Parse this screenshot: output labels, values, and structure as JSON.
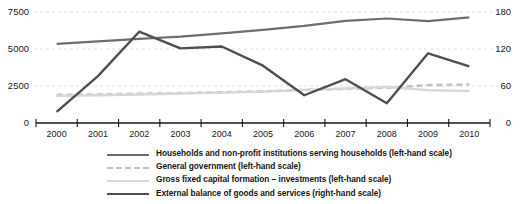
{
  "chart_data": {
    "type": "line",
    "title": "",
    "xlabel": "",
    "ylabel": "",
    "grid": true,
    "legend_position": "bottom",
    "categories": [
      "2000",
      "2001",
      "2002",
      "2003",
      "2004",
      "2005",
      "2006",
      "2007",
      "2008",
      "2009",
      "2010"
    ],
    "left_axis": {
      "label": "left-hand scale",
      "ticks": [
        "0",
        "2500",
        "5000",
        "7500"
      ],
      "tick_values": [
        0,
        2500,
        5000,
        7500
      ],
      "ylim": [
        0,
        7500
      ]
    },
    "right_axis": {
      "label": "right-hand scale",
      "ticks": [
        "0",
        "60",
        "120",
        "180"
      ],
      "tick_values": [
        0,
        60,
        120,
        180
      ],
      "ylim": [
        0,
        180
      ]
    },
    "series": [
      {
        "name": "Households and non-profit institutions serving households (left-hand scale)",
        "axis": "left",
        "style": "solid",
        "color": "#6e6e6e",
        "width": 2.2,
        "values": [
          5340,
          5520,
          5680,
          5830,
          6050,
          6290,
          6560,
          6900,
          7060,
          6880,
          7140
        ]
      },
      {
        "name": "General government (left-hand scale)",
        "axis": "left",
        "style": "dashed",
        "color": "#c2c2c2",
        "width": 2.6,
        "values": [
          1900,
          1930,
          1980,
          2020,
          2080,
          2140,
          2230,
          2300,
          2380,
          2560,
          2600
        ]
      },
      {
        "name": "Gross fixed capital formation – investments (left-hand scale)",
        "axis": "left",
        "style": "solid",
        "color": "#d7d7d7",
        "width": 2.4,
        "values": [
          1830,
          1880,
          1930,
          1990,
          2050,
          2120,
          2230,
          2330,
          2440,
          2210,
          2170
        ]
      },
      {
        "name": "External balance of goods and services (right-hand scale)",
        "axis": "right",
        "style": "solid",
        "color": "#4f4f4f",
        "width": 2.4,
        "values": [
          18,
          76,
          148,
          121,
          124,
          93,
          45,
          71,
          32,
          113,
          92
        ]
      }
    ]
  },
  "legend": {
    "items": [
      {
        "label": "Households and non-profit institutions serving households (left-hand scale)",
        "swatch": "solid-medium-gray-line"
      },
      {
        "label": "General government (left-hand scale)",
        "swatch": "dashed-light-gray-line"
      },
      {
        "label": "Gross fixed capital formation – investments (left-hand scale)",
        "swatch": "solid-pale-gray-line"
      },
      {
        "label": "External balance of goods and services (right-hand scale)",
        "swatch": "solid-dark-gray-line"
      }
    ]
  }
}
